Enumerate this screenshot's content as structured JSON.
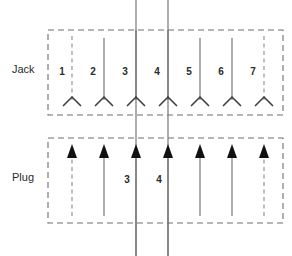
{
  "diagram": {
    "canvas": {
      "width": 292,
      "height": 256
    },
    "colors": {
      "background": "#ffffff",
      "enclosure_stroke": "#6e6e6e",
      "pin_line": "#6b6b6b",
      "pin_line_dashed": "#8a8a8a",
      "terminal": "#3a3a3a",
      "arrowhead_fill": "#111111",
      "text": "#2b2b2b"
    },
    "sections": [
      {
        "id": "jack",
        "label": "Jack",
        "terminal_type": "open-chevron",
        "enclosure": {
          "x": 48,
          "y": 30,
          "width": 235,
          "height": 85,
          "style": "dashed"
        },
        "label_position": {
          "x": 12,
          "y": 70
        },
        "pins": [
          {
            "number": "1",
            "x": 72,
            "line_style": "dashed",
            "extends_above_box": false,
            "label_x": 62,
            "label_y": 72
          },
          {
            "number": "2",
            "x": 104,
            "line_style": "solid",
            "extends_above_box": false,
            "label_x": 93,
            "label_y": 72
          },
          {
            "number": "3",
            "x": 136,
            "line_style": "solid",
            "extends_above_box": true,
            "label_x": 125,
            "label_y": 72
          },
          {
            "number": "4",
            "x": 168,
            "line_style": "solid",
            "extends_above_box": true,
            "label_x": 157,
            "label_y": 72
          },
          {
            "number": "5",
            "x": 200,
            "line_style": "solid",
            "extends_above_box": false,
            "label_x": 189,
            "label_y": 72
          },
          {
            "number": "6",
            "x": 232,
            "line_style": "solid",
            "extends_above_box": false,
            "label_x": 221,
            "label_y": 72
          },
          {
            "number": "7",
            "x": 264,
            "line_style": "dashed",
            "extends_above_box": false,
            "label_x": 253,
            "label_y": 72
          }
        ]
      },
      {
        "id": "plug",
        "label": "Plug",
        "terminal_type": "filled-arrowhead",
        "enclosure": {
          "x": 48,
          "y": 138,
          "width": 235,
          "height": 85,
          "style": "dashed"
        },
        "label_position": {
          "x": 12,
          "y": 178
        },
        "pins": [
          {
            "number": "",
            "x": 72,
            "line_style": "dashed",
            "extends_below_box": false,
            "label_x": 62,
            "label_y": 180
          },
          {
            "number": "",
            "x": 104,
            "line_style": "solid",
            "extends_below_box": false,
            "label_x": 93,
            "label_y": 180
          },
          {
            "number": "3",
            "x": 136,
            "line_style": "solid",
            "extends_below_box": true,
            "label_x": 127,
            "label_y": 180
          },
          {
            "number": "4",
            "x": 168,
            "line_style": "solid",
            "extends_below_box": true,
            "label_x": 159,
            "label_y": 180
          },
          {
            "number": "",
            "x": 200,
            "line_style": "solid",
            "extends_below_box": false,
            "label_x": 189,
            "label_y": 180
          },
          {
            "number": "",
            "x": 232,
            "line_style": "solid",
            "extends_below_box": false,
            "label_x": 221,
            "label_y": 180
          },
          {
            "number": "",
            "x": 264,
            "line_style": "dashed",
            "extends_below_box": false,
            "label_x": 253,
            "label_y": 180
          }
        ]
      }
    ],
    "bus_lines": [
      {
        "id": "bus-3",
        "x": 136,
        "y_top": 0,
        "y_bottom": 256
      },
      {
        "id": "bus-4",
        "x": 168,
        "y_top": 0,
        "y_bottom": 256
      }
    ]
  }
}
